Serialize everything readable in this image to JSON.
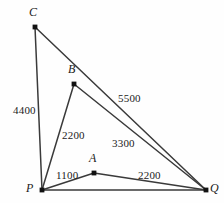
{
  "figure": {
    "kind": "geometric-diagram",
    "background_color": "#fefefe",
    "line_color": "#3a3a3a",
    "dot_color": "#111111"
  },
  "vertices": [
    {
      "id": "C",
      "label": "C",
      "x": 35,
      "y": 27,
      "label_x": 29,
      "label_y": 6
    },
    {
      "id": "B",
      "label": "B",
      "x": 74,
      "y": 84,
      "label_x": 68,
      "label_y": 63
    },
    {
      "id": "A",
      "label": "A",
      "x": 94,
      "y": 173,
      "label_x": 89,
      "label_y": 152
    },
    {
      "id": "P",
      "label": "P",
      "x": 42,
      "y": 190,
      "label_x": 26,
      "label_y": 182
    },
    {
      "id": "Q",
      "label": "Q",
      "x": 206,
      "y": 190,
      "label_x": 210,
      "label_y": 182
    }
  ],
  "edges": [
    {
      "id": "P-C",
      "from": "P",
      "to": "C"
    },
    {
      "id": "C-Q",
      "from": "C",
      "to": "Q"
    },
    {
      "id": "P-B",
      "from": "P",
      "to": "B"
    },
    {
      "id": "B-Q",
      "from": "B",
      "to": "Q"
    },
    {
      "id": "P-A",
      "from": "P",
      "to": "A"
    },
    {
      "id": "A-Q",
      "from": "A",
      "to": "Q"
    },
    {
      "id": "P-Q",
      "from": "P",
      "to": "Q"
    }
  ],
  "edge_labels": [
    {
      "id": "label-PC",
      "edge": "P-C",
      "value": "4400",
      "x": 13,
      "y": 105
    },
    {
      "id": "label-PB",
      "edge": "P-B",
      "value": "2200",
      "x": 62,
      "y": 130
    },
    {
      "id": "label-CQ",
      "edge": "C-Q",
      "value": "5500",
      "x": 118,
      "y": 93
    },
    {
      "id": "label-BQ",
      "edge": "B-Q",
      "value": "3300",
      "x": 112,
      "y": 138
    },
    {
      "id": "label-PA",
      "edge": "P-A",
      "value": "1100",
      "x": 56,
      "y": 170
    },
    {
      "id": "label-AQ",
      "edge": "A-Q",
      "value": "2200",
      "x": 138,
      "y": 170
    }
  ]
}
